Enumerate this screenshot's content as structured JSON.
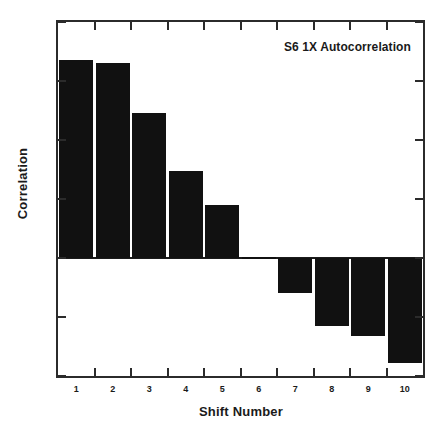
{
  "chart_data": {
    "type": "bar",
    "title": "S6 1X Autocorrelation",
    "xlabel": "Shift Number",
    "ylabel": "Correlation",
    "categories": [
      "1",
      "2",
      "3",
      "4",
      "5",
      "6",
      "7",
      "8",
      "9",
      "10"
    ],
    "values": [
      0.67,
      0.66,
      0.49,
      0.295,
      0.18,
      0.005,
      -0.12,
      -0.23,
      -0.265,
      -0.355
    ],
    "ylim": [
      -0.4,
      0.8
    ],
    "xlim": [
      0.5,
      10.5
    ],
    "yticks": [
      0.8,
      0.6,
      0.4,
      0.2,
      0,
      -0.2,
      -0.4
    ],
    "ytick_labels": [
      "0.8",
      "0.6",
      "0.4",
      "0.2",
      "0",
      "-0.2",
      "-0.4"
    ],
    "xtick_labels": [
      "1",
      "2",
      "3",
      "4",
      "5",
      "6",
      "7",
      "8",
      "9",
      "10"
    ],
    "grid": false,
    "legend": "none",
    "bar_color": "#111111",
    "axis_color": "#2b2b2b",
    "background": "#ffffff",
    "title_position": "inside-top-right"
  }
}
